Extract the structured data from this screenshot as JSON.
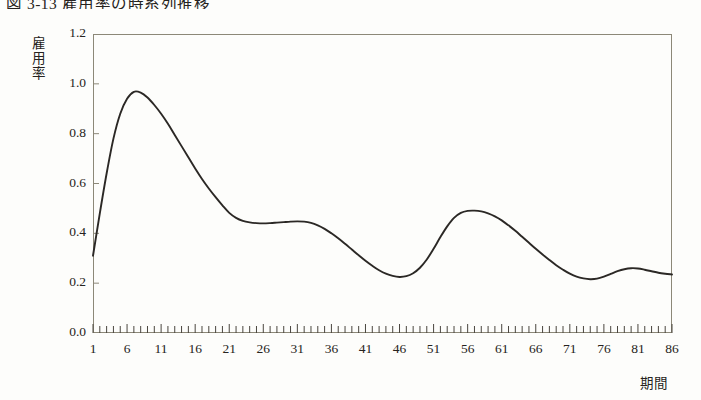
{
  "figure": {
    "title": "図 3-13  雇用率の時系列推移",
    "background_color": "#fdfdfb",
    "frame_color": "#8c8878",
    "line_color": "#2b2825"
  },
  "chart_data": {
    "type": "line",
    "title": "図 3-13  雇用率の時系列推移",
    "xlabel": "期間",
    "ylabel": "雇用率",
    "xlim": [
      1,
      86
    ],
    "ylim": [
      0.0,
      1.2
    ],
    "grid": false,
    "legend": null,
    "y_ticks": [
      "0.0",
      "0.2",
      "0.4",
      "0.6",
      "0.8",
      "1.0",
      "1.2"
    ],
    "y_tick_values": [
      0.0,
      0.2,
      0.4,
      0.6,
      0.8,
      1.0,
      1.2
    ],
    "x_ticks": [
      "1",
      "6",
      "11",
      "16",
      "21",
      "26",
      "31",
      "36",
      "41",
      "46",
      "51",
      "56",
      "61",
      "66",
      "71",
      "76",
      "81",
      "86"
    ],
    "x_tick_values": [
      1,
      6,
      11,
      16,
      21,
      26,
      31,
      36,
      41,
      46,
      51,
      56,
      61,
      66,
      71,
      76,
      81,
      86
    ],
    "x_minor_tick_step": 1,
    "series": [
      {
        "name": "雇用率",
        "color": "#2b2825",
        "x": [
          1,
          2,
          3,
          4,
          5,
          6,
          7,
          8,
          9,
          10,
          11,
          12,
          13,
          14,
          15,
          16,
          17,
          18,
          19,
          20,
          21,
          22,
          23,
          24,
          25,
          26,
          27,
          28,
          29,
          30,
          31,
          32,
          33,
          34,
          35,
          36,
          37,
          38,
          39,
          40,
          41,
          42,
          43,
          44,
          45,
          46,
          47,
          48,
          49,
          50,
          51,
          52,
          53,
          54,
          55,
          56,
          57,
          58,
          59,
          60,
          61,
          62,
          63,
          64,
          65,
          66,
          67,
          68,
          69,
          70,
          71,
          72,
          73,
          74,
          75,
          76,
          77,
          78,
          79,
          80,
          81,
          82,
          83,
          84,
          85,
          86
        ],
        "values": [
          0.31,
          0.48,
          0.64,
          0.78,
          0.88,
          0.94,
          0.968,
          0.965,
          0.945,
          0.915,
          0.88,
          0.84,
          0.795,
          0.75,
          0.705,
          0.66,
          0.618,
          0.58,
          0.545,
          0.512,
          0.482,
          0.462,
          0.45,
          0.444,
          0.441,
          0.44,
          0.441,
          0.443,
          0.445,
          0.447,
          0.448,
          0.447,
          0.442,
          0.432,
          0.418,
          0.4,
          0.38,
          0.358,
          0.335,
          0.312,
          0.29,
          0.27,
          0.252,
          0.238,
          0.229,
          0.225,
          0.228,
          0.24,
          0.262,
          0.295,
          0.338,
          0.385,
          0.428,
          0.462,
          0.482,
          0.49,
          0.491,
          0.488,
          0.48,
          0.468,
          0.452,
          0.432,
          0.41,
          0.386,
          0.362,
          0.338,
          0.315,
          0.293,
          0.272,
          0.254,
          0.238,
          0.226,
          0.219,
          0.216,
          0.218,
          0.226,
          0.237,
          0.248,
          0.256,
          0.26,
          0.259,
          0.254,
          0.248,
          0.242,
          0.238,
          0.235
        ]
      }
    ]
  }
}
